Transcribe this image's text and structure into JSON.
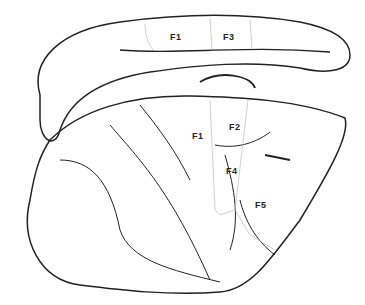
{
  "diagram": {
    "labels": {
      "top_f1": "F1",
      "top_f3": "F3",
      "lat_f1": "F1",
      "lat_f2": "F2",
      "lat_f4": "F4",
      "lat_f5": "F5"
    },
    "line_color": "#222222",
    "border_color": "#bbbbbb"
  }
}
